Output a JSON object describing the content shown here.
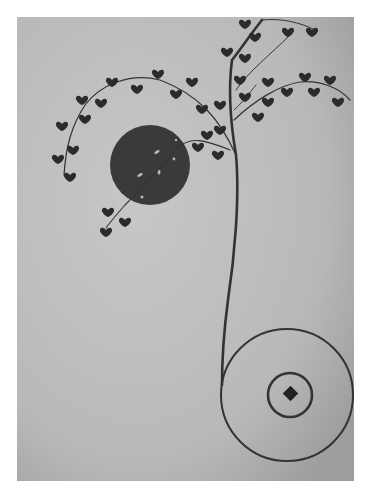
{
  "artwork": {
    "description": "Grayscale reproduction of a painting: a thin tree with heart-shaped dark leaves arching over a dark sun disc, its trunk descending and looping into a large circle containing a small ring and a central diamond.",
    "colors": {
      "paper": "#bdbdbd",
      "paper_dark": "#9e9e9e",
      "ink": "#2b2b2b",
      "disc": "#3a3a3a",
      "border": "#ffffff"
    },
    "elements": {
      "sun_disc": {
        "cx": 150,
        "cy": 165,
        "r": 40
      },
      "outer_circle": {
        "cx": 287,
        "cy": 395,
        "r": 66
      },
      "inner_ring": {
        "cx": 290,
        "cy": 395,
        "r": 22
      },
      "center_diamond": {
        "cx": 291,
        "cy": 394,
        "size": 7
      }
    }
  }
}
